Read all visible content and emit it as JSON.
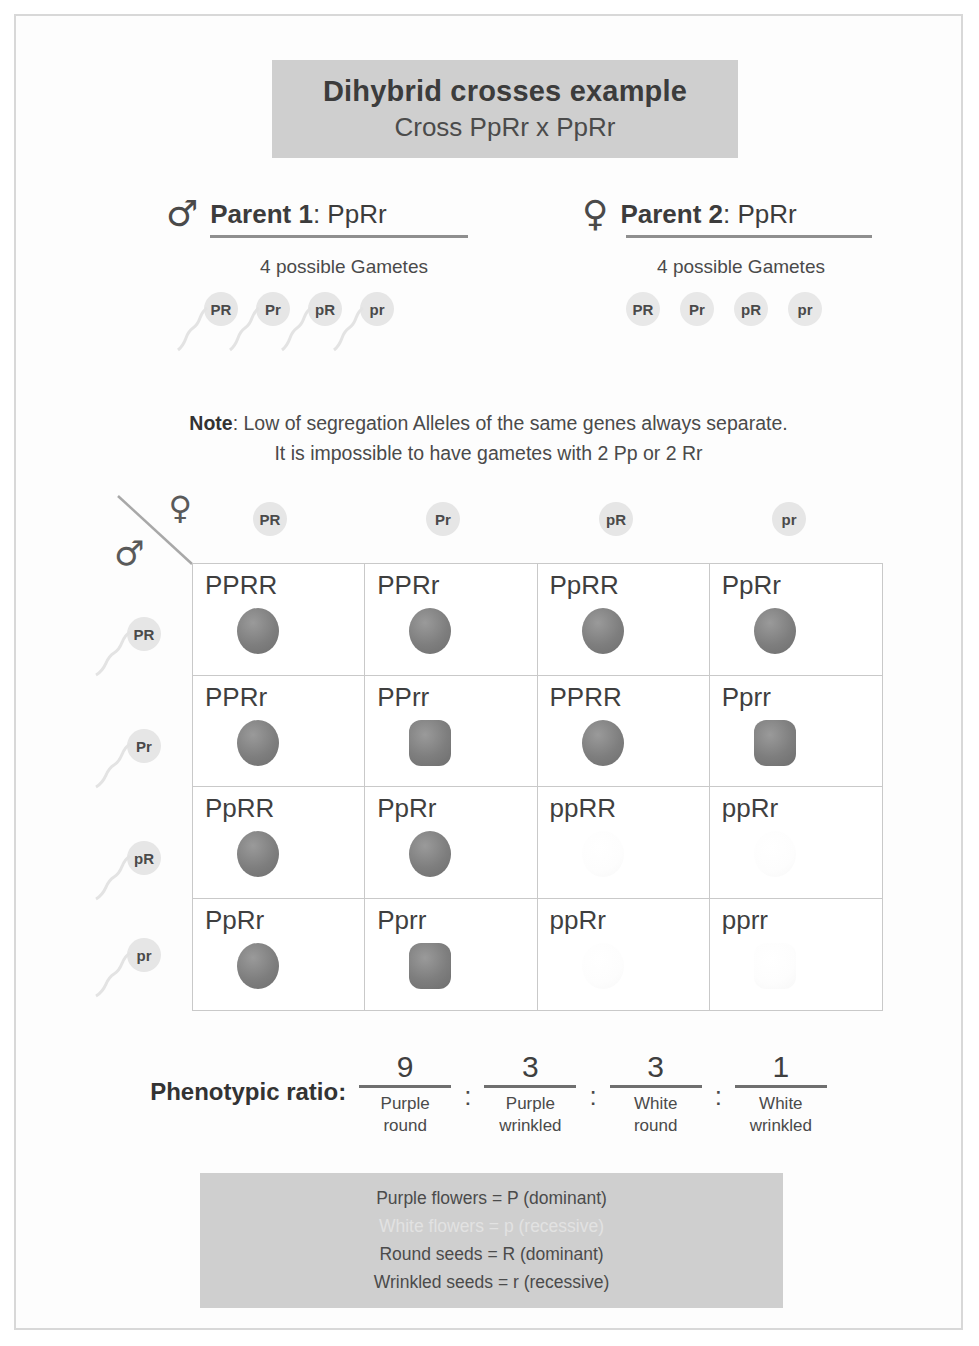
{
  "header": {
    "title": "Dihybrid crosses example",
    "subtitle": "Cross PpRr x PpRr"
  },
  "parent1": {
    "symbol": "♂",
    "symbol_name": "male-symbol",
    "label_prefix": "Parent 1",
    "label_suffix": ": PpRr",
    "gamete_count": "4 possible Gametes",
    "gametes": [
      "PR",
      "Pr",
      "pR",
      "pr"
    ]
  },
  "parent2": {
    "symbol": "♀",
    "symbol_name": "female-symbol",
    "label_prefix": "Parent 2",
    "label_suffix": ": PpRr",
    "gamete_count": "4 possible Gametes",
    "gametes": [
      "PR",
      "Pr",
      "pR",
      "pr"
    ]
  },
  "note": {
    "bold": "Note",
    "line1": ": Low of segregation Alleles of the same genes always separate.",
    "line2": "It is impossible to have gametes with 2 Pp or 2 Rr"
  },
  "punnett": {
    "corner_male": "♂",
    "corner_female": "♀",
    "columns": [
      "PR",
      "Pr",
      "pR",
      "pr"
    ],
    "rows": [
      "PR",
      "Pr",
      "pR",
      "pr"
    ],
    "cells": [
      {
        "genotype": "PPRR",
        "flower": "purple",
        "seed": "round"
      },
      {
        "genotype": "PPRr",
        "flower": "purple",
        "seed": "round"
      },
      {
        "genotype": "PpRR",
        "flower": "purple",
        "seed": "round"
      },
      {
        "genotype": "PpRr",
        "flower": "purple",
        "seed": "round"
      },
      {
        "genotype": "PPRr",
        "flower": "purple",
        "seed": "round"
      },
      {
        "genotype": "PPrr",
        "flower": "purple",
        "seed": "wrinkled"
      },
      {
        "genotype": "PPRR",
        "flower": "purple",
        "seed": "round"
      },
      {
        "genotype": "Pprr",
        "flower": "purple",
        "seed": "wrinkled"
      },
      {
        "genotype": "PpRR",
        "flower": "purple",
        "seed": "round"
      },
      {
        "genotype": "PpRr",
        "flower": "purple",
        "seed": "round"
      },
      {
        "genotype": "ppRR",
        "flower": "white",
        "seed": "round"
      },
      {
        "genotype": "ppRr",
        "flower": "white",
        "seed": "round"
      },
      {
        "genotype": "PpRr",
        "flower": "purple",
        "seed": "round"
      },
      {
        "genotype": "Pprr",
        "flower": "purple",
        "seed": "wrinkled"
      },
      {
        "genotype": "ppRr",
        "flower": "white",
        "seed": "round"
      },
      {
        "genotype": "pprr",
        "flower": "white",
        "seed": "wrinkled"
      }
    ]
  },
  "ratio": {
    "label": "Phenotypic ratio:",
    "separator": ":",
    "items": [
      {
        "value": "9",
        "line1": "Purple",
        "line2": "round"
      },
      {
        "value": "3",
        "line1": "Purple",
        "line2": "wrinkled"
      },
      {
        "value": "3",
        "line1": "White",
        "line2": "round"
      },
      {
        "value": "1",
        "line1": "White",
        "line2": "wrinkled"
      }
    ]
  },
  "legend": {
    "lines": [
      {
        "text": "Purple flowers = P (dominant)",
        "faded": false
      },
      {
        "text": "White flowers = p (recessive)",
        "faded": true
      },
      {
        "text": "Round seeds = R (dominant)",
        "faded": false
      },
      {
        "text": "Wrinkled seeds = r (recessive)",
        "faded": false
      }
    ]
  }
}
